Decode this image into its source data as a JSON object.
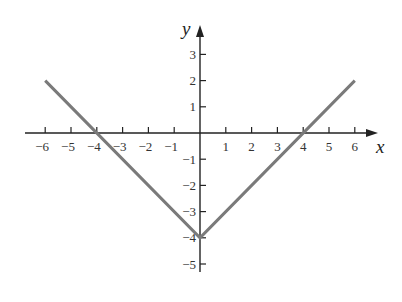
{
  "chart_data": {
    "type": "line",
    "title": "",
    "xlabel": "x",
    "ylabel": "y",
    "xlim": [
      -6,
      6
    ],
    "ylim": [
      -5,
      3
    ],
    "x_ticks": [
      -6,
      -5,
      -4,
      -3,
      -2,
      -1,
      1,
      2,
      3,
      4,
      5,
      6
    ],
    "x_tick_labels": [
      "−6",
      "−5",
      "−4",
      "−3",
      "−2",
      "−1",
      "1",
      "2",
      "3",
      "4",
      "5",
      "6"
    ],
    "y_ticks": [
      3,
      2,
      1,
      -1,
      -2,
      -3,
      -4,
      -5
    ],
    "y_tick_labels": [
      "3",
      "2",
      "1",
      "−1",
      "−2",
      "−3",
      "−4",
      "−5"
    ],
    "grid": false,
    "series": [
      {
        "name": "y = |x| - 4",
        "x": [
          -6,
          0,
          6
        ],
        "y": [
          2,
          -4,
          2
        ],
        "color": "#7a7a7a"
      }
    ],
    "axis_color": "#222222"
  }
}
